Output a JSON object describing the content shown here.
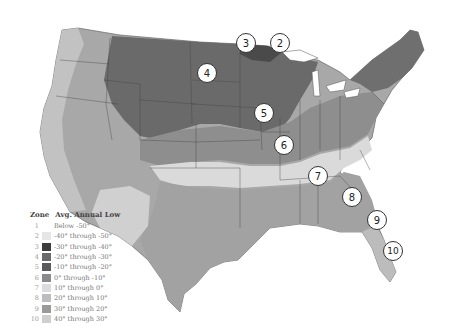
{
  "map": {
    "title": "USDA Plant Hardiness Zones (contiguous United States)",
    "markers": [
      {
        "label": "3",
        "x": 246,
        "y": 43
      },
      {
        "label": "2",
        "x": 280,
        "y": 43
      },
      {
        "label": "4",
        "x": 207,
        "y": 73
      },
      {
        "label": "5",
        "x": 264,
        "y": 113
      },
      {
        "label": "6",
        "x": 284,
        "y": 145
      },
      {
        "label": "7",
        "x": 318,
        "y": 176
      },
      {
        "label": "8",
        "x": 352,
        "y": 197
      },
      {
        "label": "9",
        "x": 377,
        "y": 220
      },
      {
        "label": "10",
        "x": 393,
        "y": 251
      }
    ]
  },
  "legend": {
    "zone_header": "Zone",
    "temp_header": "Avg. Annual Low",
    "rows": [
      {
        "zone": "1",
        "range": "Below -50°",
        "color": "#ffffff"
      },
      {
        "zone": "2",
        "range": "-40° through -50°",
        "color": "#e6e6e6"
      },
      {
        "zone": "3",
        "range": "-30° through -40°",
        "color": "#3c3c3c"
      },
      {
        "zone": "4",
        "range": "-20° through -30°",
        "color": "#6a6a6a"
      },
      {
        "zone": "5",
        "range": "-10° through -20°",
        "color": "#5a5a5a"
      },
      {
        "zone": "6",
        "range": "0° through -10°",
        "color": "#8a8a8a"
      },
      {
        "zone": "7",
        "range": "10° through 0°",
        "color": "#dcdcdc"
      },
      {
        "zone": "8",
        "range": "20° through 10°",
        "color": "#bdbdbd"
      },
      {
        "zone": "9",
        "range": "30° through 20°",
        "color": "#9a9a9a"
      },
      {
        "zone": "10",
        "range": "40° through 30°",
        "color": "#cfcfcf"
      }
    ]
  }
}
